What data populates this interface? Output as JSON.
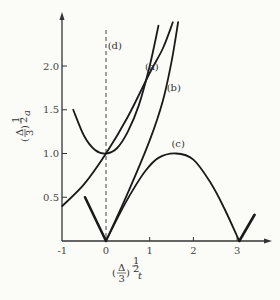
{
  "chart_data": {
    "type": "line",
    "title": "",
    "xlabel": "(Δ/3)^(1/2) t",
    "ylabel": "(Δ/3)^(1/2) a",
    "xlim": [
      -1,
      3.6
    ],
    "ylim": [
      0,
      2.6
    ],
    "x_ticks": [
      "-1",
      "0",
      "1",
      "2",
      "3"
    ],
    "y_ticks": [
      "0.5",
      "1.0",
      "1.5",
      "2.0"
    ],
    "grid": false,
    "legend": "inline curve labels",
    "reference_line": {
      "type": "vertical-dashed",
      "x": 0
    },
    "series": [
      {
        "name": "(d)",
        "label_pos": [
          0.2,
          2.2
        ],
        "points": [
          [
            -0.75,
            1.5
          ],
          [
            -0.5,
            1.2
          ],
          [
            -0.25,
            1.04
          ],
          [
            0,
            1.0
          ],
          [
            0.25,
            1.06
          ],
          [
            0.5,
            1.25
          ],
          [
            0.75,
            1.55
          ],
          [
            1.0,
            2.0
          ],
          [
            1.2,
            2.46
          ]
        ]
      },
      {
        "name": "(a)",
        "label_pos": [
          1.05,
          1.95
        ],
        "points": [
          [
            -1,
            0.4
          ],
          [
            -0.5,
            0.65
          ],
          [
            0,
            1.0
          ],
          [
            0.5,
            1.42
          ],
          [
            1.0,
            1.92
          ],
          [
            1.3,
            2.2
          ],
          [
            1.53,
            2.5
          ]
        ]
      },
      {
        "name": "(b)",
        "label_pos": [
          1.55,
          1.72
        ],
        "points": [
          [
            0,
            0
          ],
          [
            0.5,
            0.55
          ],
          [
            1.0,
            1.15
          ],
          [
            1.3,
            1.6
          ],
          [
            1.5,
            2.05
          ],
          [
            1.65,
            2.5
          ]
        ]
      },
      {
        "name": "(c)",
        "label_pos": [
          1.65,
          1.07
        ],
        "points": [
          [
            0,
            0
          ],
          [
            0.3,
            0.3
          ],
          [
            0.6,
            0.57
          ],
          [
            0.9,
            0.8
          ],
          [
            1.2,
            0.95
          ],
          [
            1.6,
            1.0
          ],
          [
            2.0,
            0.93
          ],
          [
            2.4,
            0.66
          ],
          [
            2.7,
            0.38
          ],
          [
            3.05,
            0
          ]
        ]
      },
      {
        "name": "left-branch",
        "label_pos": null,
        "points": [
          [
            -0.48,
            0.5
          ],
          [
            0,
            0
          ]
        ]
      },
      {
        "name": "right-branch",
        "label_pos": null,
        "points": [
          [
            3.05,
            0
          ],
          [
            3.4,
            0.3
          ]
        ]
      }
    ]
  }
}
